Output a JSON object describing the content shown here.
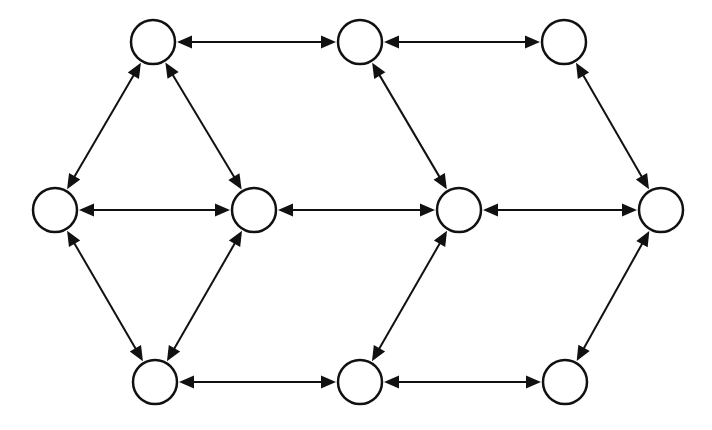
{
  "diagram": {
    "type": "graph",
    "directed": "bidirectional",
    "colors": {
      "stroke": "#111111",
      "node_fill": "#ffffff",
      "background": "#ffffff"
    },
    "node_radius": 22,
    "nodes": [
      {
        "id": "n1",
        "x": 153,
        "y": 42,
        "label": ""
      },
      {
        "id": "n2",
        "x": 360,
        "y": 42,
        "label": ""
      },
      {
        "id": "n3",
        "x": 564,
        "y": 42,
        "label": ""
      },
      {
        "id": "n4",
        "x": 55,
        "y": 210,
        "label": ""
      },
      {
        "id": "n5",
        "x": 254,
        "y": 210,
        "label": ""
      },
      {
        "id": "n6",
        "x": 459,
        "y": 210,
        "label": ""
      },
      {
        "id": "n7",
        "x": 661,
        "y": 210,
        "label": ""
      },
      {
        "id": "n8",
        "x": 155,
        "y": 382,
        "label": ""
      },
      {
        "id": "n9",
        "x": 360,
        "y": 382,
        "label": ""
      },
      {
        "id": "n10",
        "x": 565,
        "y": 382,
        "label": ""
      }
    ],
    "edges": [
      {
        "from": "n1",
        "to": "n2",
        "arrows": "both"
      },
      {
        "from": "n2",
        "to": "n3",
        "arrows": "both"
      },
      {
        "from": "n4",
        "to": "n5",
        "arrows": "both"
      },
      {
        "from": "n5",
        "to": "n6",
        "arrows": "both"
      },
      {
        "from": "n6",
        "to": "n7",
        "arrows": "both"
      },
      {
        "from": "n8",
        "to": "n9",
        "arrows": "both"
      },
      {
        "from": "n9",
        "to": "n10",
        "arrows": "both"
      },
      {
        "from": "n1",
        "to": "n4",
        "arrows": "both"
      },
      {
        "from": "n1",
        "to": "n5",
        "arrows": "both"
      },
      {
        "from": "n4",
        "to": "n8",
        "arrows": "both"
      },
      {
        "from": "n5",
        "to": "n8",
        "arrows": "both"
      },
      {
        "from": "n2",
        "to": "n6",
        "arrows": "both"
      },
      {
        "from": "n6",
        "to": "n9",
        "arrows": "both"
      },
      {
        "from": "n3",
        "to": "n7",
        "arrows": "both"
      },
      {
        "from": "n7",
        "to": "n10",
        "arrows": "both"
      }
    ]
  }
}
